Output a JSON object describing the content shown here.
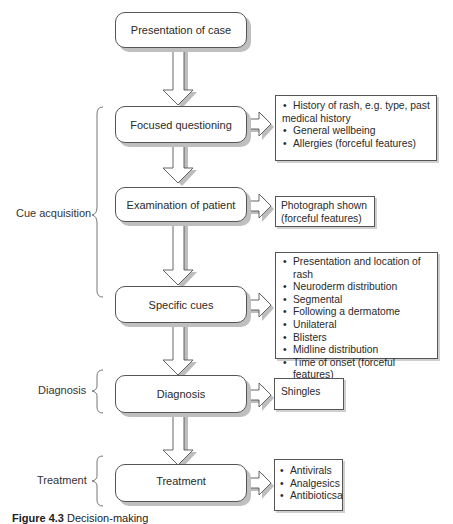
{
  "diagram": {
    "nodes": [
      {
        "id": "presentation",
        "label": "Presentation of case"
      },
      {
        "id": "focused",
        "label": "Focused questioning"
      },
      {
        "id": "examination",
        "label": "Examination of patient"
      },
      {
        "id": "specific",
        "label": "Specific cues"
      },
      {
        "id": "diagnosis",
        "label": "Diagnosis"
      },
      {
        "id": "treatment",
        "label": "Treatment"
      }
    ],
    "notes": {
      "focused": {
        "items": [
          "History of rash, e.g. type, past",
          "medical history",
          "General wellbeing",
          "Allergies (forceful features)"
        ]
      },
      "examination": {
        "lines": [
          "Photograph shown",
          "(forceful features)"
        ]
      },
      "specific": {
        "items": [
          "Presentation and location of rash",
          "Neuroderm distribution",
          "Segmental",
          "Following a dermatome",
          "Unilateral",
          "Blisters",
          "Midline distribution",
          "Time of onset (forceful features)"
        ]
      },
      "diagnosis": {
        "lines": [
          "Shingles"
        ]
      },
      "treatment": {
        "items": [
          "Antivirals",
          "Analgesics",
          "Antibioticsa"
        ]
      }
    },
    "phases": [
      {
        "label": "Cue acquisition"
      },
      {
        "label": "Diagnosis"
      },
      {
        "label": "Treatment"
      }
    ],
    "caption": {
      "number": "Figure 4.3",
      "text": "Decision-making"
    }
  }
}
